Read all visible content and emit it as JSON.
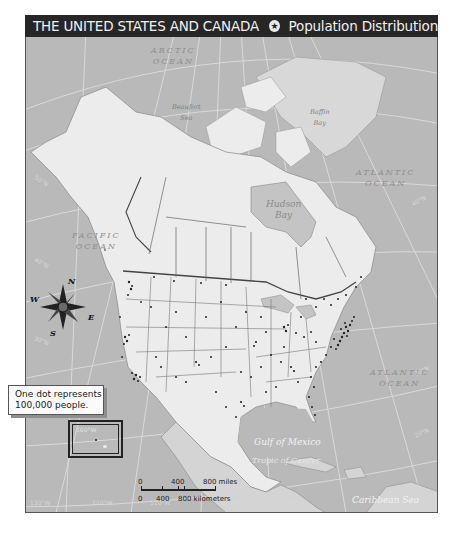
{
  "title": {
    "main": "THE UNITED STATES AND CANADA",
    "separator_icon": "star-in-circle-icon",
    "subtitle": "Population Distribution"
  },
  "water_labels": {
    "arctic_ocean": "ARCTIC\nOCEAN",
    "arctic_ocean_line1": "ARCTIC",
    "arctic_ocean_line2": "OCEAN",
    "beaufort_sea_line1": "Beaufort",
    "beaufort_sea_line2": "Sea",
    "baffin_bay_line1": "Baffin",
    "baffin_bay_line2": "Bay",
    "hudson_bay_line1": "Hudson",
    "hudson_bay_line2": "Bay",
    "pacific_ocean_line1": "PACIFIC",
    "pacific_ocean_line2": "OCEAN",
    "atlantic_ocean_north_line1": "ATLANTIC",
    "atlantic_ocean_north_line2": "OCEAN",
    "atlantic_ocean_south_line1": "ATLANTIC",
    "atlantic_ocean_south_line2": "OCEAN",
    "gulf_of_mexico": "Gulf of Mexico",
    "tropic_of_cancer": "Tropic of Cancer",
    "caribbean_sea": "Caribbean Sea",
    "arctic_circle": "Arctic Circle"
  },
  "latitude_labels": [
    "70°N",
    "60°N",
    "50°N",
    "40°N",
    "30°N",
    "20°N"
  ],
  "latitude_labels_left": {
    "l50": "50°N",
    "l40": "40°N",
    "l30": "30°N"
  },
  "latitude_labels_right": {
    "r60": "60°N",
    "r40": "40°N",
    "r30": "30°N",
    "r20": "20°N"
  },
  "longitude_labels": {
    "w130": "130°W",
    "w120": "120°W",
    "w110": "110°W",
    "w100": "100°W",
    "w90": "90°W"
  },
  "inset": {
    "label": "160°W"
  },
  "compass": {
    "icon": "compass-rose-icon",
    "n": "N",
    "s": "S",
    "e": "E",
    "w": "W"
  },
  "legend": {
    "line1": "One dot represents",
    "line2": "100,000 people."
  },
  "scale_bar": {
    "miles": [
      "0",
      "400",
      "800 miles"
    ],
    "kilometers": [
      "0",
      "400",
      "800 kilometers"
    ]
  },
  "colors": {
    "water": "#b9b9b9",
    "land": "#ececec",
    "other_land": "#d6d6d6",
    "title_bar": "#262626",
    "grid": "#dcdcdc",
    "border": "#444444"
  }
}
